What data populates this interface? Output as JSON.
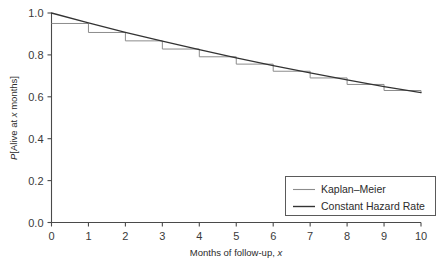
{
  "chart_data": {
    "type": "line",
    "title": "",
    "xlabel": "Months of follow-up, x",
    "ylabel": "P[Alive at x months]",
    "xlim": [
      0,
      10
    ],
    "ylim": [
      0,
      1
    ],
    "grid": false,
    "legend_position": "bottom-right",
    "xticks": [
      "0",
      "1",
      "2",
      "3",
      "4",
      "5",
      "6",
      "7",
      "8",
      "9",
      "10"
    ],
    "xtick_values": [
      0,
      1,
      2,
      3,
      4,
      5,
      6,
      7,
      8,
      9,
      10
    ],
    "yticks": [
      "0.0",
      "0.2",
      "0.4",
      "0.6",
      "0.8",
      "1.0"
    ],
    "ytick_values": [
      0.0,
      0.2,
      0.4,
      0.6,
      0.8,
      1.0
    ],
    "series": [
      {
        "name": "Kaplan-Meier",
        "legend_label": "Kaplan–Meier",
        "style": "step",
        "color": "#8c8c8c",
        "x": [
          0,
          1,
          2,
          3,
          4,
          5,
          6,
          7,
          8,
          9,
          10
        ],
        "values": [
          0.95,
          0.907,
          0.867,
          0.828,
          0.791,
          0.756,
          0.722,
          0.69,
          0.659,
          0.63,
          0.62
        ]
      },
      {
        "name": "Constant Hazard Rate",
        "legend_label": "Constant Hazard Rate",
        "style": "line",
        "color": "#333333",
        "x": [
          0,
          1,
          2,
          3,
          4,
          5,
          6,
          7,
          8,
          9,
          10
        ],
        "values": [
          1.0,
          0.953,
          0.908,
          0.866,
          0.825,
          0.786,
          0.749,
          0.714,
          0.681,
          0.649,
          0.62
        ]
      }
    ]
  },
  "axes": {
    "y_label_prefix": "P",
    "y_label_open": "[Alive at ",
    "y_label_italic": "x",
    "y_label_close": " months]",
    "x_label_main": "Months of follow-up, ",
    "x_label_italic": "x"
  },
  "legend": {
    "items": [
      {
        "label": "Kaplan–Meier",
        "color": "#8c8c8c"
      },
      {
        "label": "Constant Hazard Rate",
        "color": "#333333"
      }
    ]
  },
  "colors": {
    "axis": "#4a4a4a",
    "km": "#8c8c8c",
    "hazard": "#333333",
    "legend_border": "#5a5a5a",
    "background": "#ffffff"
  }
}
